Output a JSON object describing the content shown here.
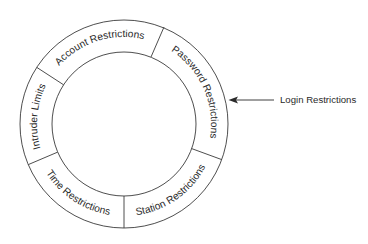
{
  "diagram": {
    "type": "ring",
    "segments": [
      {
        "label": "Account Restrictions",
        "start_deg": 303,
        "end_deg": 22,
        "direction": "cw"
      },
      {
        "label": "Password Restrictions",
        "start_deg": 22,
        "end_deg": 110,
        "direction": "cw"
      },
      {
        "label": "Station Restrictions",
        "start_deg": 110,
        "end_deg": 180,
        "direction": "ccw"
      },
      {
        "label": "Time Restrictions",
        "start_deg": 180,
        "end_deg": 247,
        "direction": "ccw"
      },
      {
        "label": "Intruder Limits",
        "start_deg": 247,
        "end_deg": 303,
        "direction": "cw"
      }
    ],
    "callout": {
      "label": "Login Restrictions",
      "arrow_direction": "left"
    },
    "colors": {
      "line": "#3a3a3a",
      "text": "#2a2a2a",
      "background": "#ffffff"
    }
  }
}
